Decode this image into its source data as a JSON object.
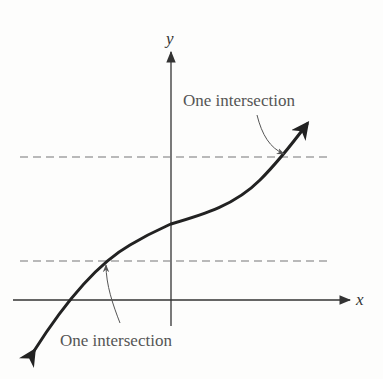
{
  "diagram": {
    "type": "horizontal-line-test",
    "axes": {
      "x_label": "x",
      "y_label": "y"
    },
    "horizontal_lines": [
      {
        "name": "upper",
        "style": "dashed"
      },
      {
        "name": "lower",
        "style": "dashed"
      }
    ],
    "annotations": [
      {
        "text": "One intersection",
        "position": "upper-right",
        "points_to": "upper dashed line crossing"
      },
      {
        "text": "One intersection",
        "position": "bottom-left",
        "points_to": "lower dashed line crossing"
      }
    ],
    "curve": {
      "description": "increasing cubic-like curve with arrowheads at both ends"
    },
    "colors": {
      "background": "#fdfdfc",
      "axes": "#333333",
      "curve": "#222222",
      "dashed": "#777777",
      "text": "#555555"
    }
  }
}
